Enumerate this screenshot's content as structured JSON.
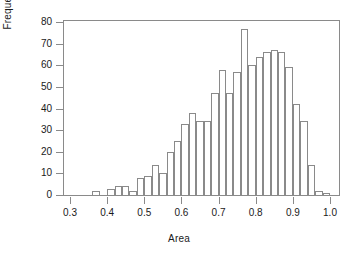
{
  "chart_data": {
    "type": "bar",
    "chart_subtype": "histogram",
    "title": "",
    "xlabel": "Area",
    "ylabel": "Frequency",
    "xlim": [
      0.3,
      1.0
    ],
    "ylim": [
      0,
      80
    ],
    "grid": false,
    "legend": null,
    "bin_width": 0.02,
    "xticks": [
      0.3,
      0.4,
      0.5,
      0.6,
      0.7,
      0.8,
      0.9,
      1.0
    ],
    "xtick_labels": [
      "0.3",
      "0.4",
      "0.5",
      "0.6",
      "0.7",
      "0.8",
      "0.9",
      "1.0"
    ],
    "yticks": [
      0,
      10,
      20,
      30,
      40,
      50,
      60,
      70,
      80
    ],
    "ytick_labels": [
      "0",
      "10",
      "20",
      "30",
      "40",
      "50",
      "60",
      "70",
      "80"
    ],
    "bin_edges": [
      0.36,
      0.38,
      0.4,
      0.42,
      0.44,
      0.46,
      0.48,
      0.5,
      0.52,
      0.54,
      0.56,
      0.58,
      0.6,
      0.62,
      0.64,
      0.66,
      0.68,
      0.7,
      0.72,
      0.74,
      0.76,
      0.78,
      0.8,
      0.82,
      0.84,
      0.86,
      0.88,
      0.9,
      0.92,
      0.94,
      0.96,
      0.98,
      1.0
    ],
    "categories": [
      "0.36-0.38",
      "0.38-0.40",
      "0.40-0.42",
      "0.42-0.44",
      "0.44-0.46",
      "0.46-0.48",
      "0.48-0.50",
      "0.50-0.52",
      "0.52-0.54",
      "0.54-0.56",
      "0.56-0.58",
      "0.58-0.60",
      "0.60-0.62",
      "0.62-0.64",
      "0.64-0.66",
      "0.66-0.68",
      "0.68-0.70",
      "0.70-0.72",
      "0.72-0.74",
      "0.74-0.76",
      "0.76-0.78",
      "0.78-0.80",
      "0.80-0.82",
      "0.82-0.84",
      "0.84-0.86",
      "0.86-0.88",
      "0.88-0.90",
      "0.90-0.92",
      "0.92-0.94",
      "0.94-0.96",
      "0.96-0.98",
      "0.98-1.00"
    ],
    "values": [
      2,
      0,
      3,
      4,
      4,
      2,
      8,
      9,
      14,
      10,
      20,
      25,
      33,
      38,
      34,
      34,
      47,
      58,
      47,
      57,
      77,
      60,
      64,
      66,
      67,
      66,
      59,
      42,
      34,
      14,
      2,
      1
    ],
    "colors": {
      "bar_fill": "#ffffff",
      "bar_stroke": "#8a8a8a",
      "axis": "#8a8a8a",
      "text": "#1a1a1a"
    }
  }
}
